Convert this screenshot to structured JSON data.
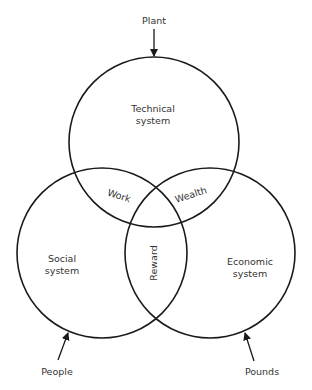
{
  "diagram": {
    "type": "venn",
    "sets": [
      {
        "id": "technical",
        "label_line1": "Technical",
        "label_line2": "system",
        "input": "Plant"
      },
      {
        "id": "social",
        "label_line1": "Social",
        "label_line2": "system",
        "input": "People"
      },
      {
        "id": "economic",
        "label_line1": "Economic",
        "label_line2": "system",
        "input": "Pounds"
      }
    ],
    "intersections": {
      "technical_social": "Work",
      "technical_economic": "Wealth",
      "social_economic": "Reward"
    },
    "colors": {
      "stroke": "#1a1a1a",
      "text": "#333333",
      "background": "#ffffff"
    }
  }
}
